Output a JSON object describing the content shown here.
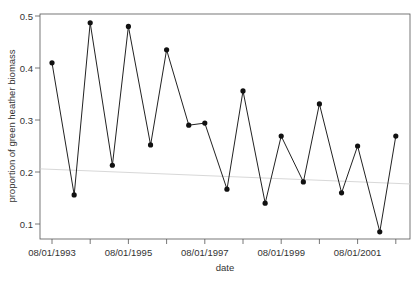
{
  "chart_data": {
    "type": "line",
    "title": "",
    "xlabel": "date",
    "ylabel": "proportion of green heather biomass",
    "ylim": [
      0.07,
      0.505
    ],
    "yticks": [
      0.1,
      0.2,
      0.3,
      0.4,
      0.5
    ],
    "ytick_labels": [
      "0.1",
      "0.2",
      "0.3",
      "0.4",
      "0.5"
    ],
    "xtick_labels": [
      "08/01/1993",
      "",
      "08/01/1995",
      "",
      "08/01/1997",
      "",
      "08/01/1999",
      "",
      "08/01/2001",
      ""
    ],
    "xtick_years": [
      1993,
      1994,
      1995,
      1996,
      1997,
      1998,
      1999,
      2000,
      2001,
      2002
    ],
    "grid": false,
    "legend": null,
    "series": [
      {
        "name": "green heather proportion",
        "color": "#222222",
        "marker": "filled-circle",
        "x": [
          1993.0,
          1993.58,
          1994.0,
          1994.58,
          1995.0,
          1995.58,
          1996.0,
          1996.58,
          1997.0,
          1997.58,
          1998.0,
          1998.58,
          1999.0,
          1999.58,
          2000.0,
          2000.58,
          2001.0,
          2001.58,
          2002.0
        ],
        "values": [
          0.41,
          0.156,
          0.487,
          0.213,
          0.48,
          0.252,
          0.435,
          0.29,
          0.294,
          0.167,
          0.356,
          0.14,
          0.269,
          0.181,
          0.331,
          0.16,
          0.25,
          0.085,
          0.269
        ]
      }
    ],
    "trend_line": {
      "color": "#d8d8d8",
      "start": {
        "x": 1992.7,
        "y": 0.206
      },
      "end": {
        "x": 2002.4,
        "y": 0.177
      }
    }
  }
}
